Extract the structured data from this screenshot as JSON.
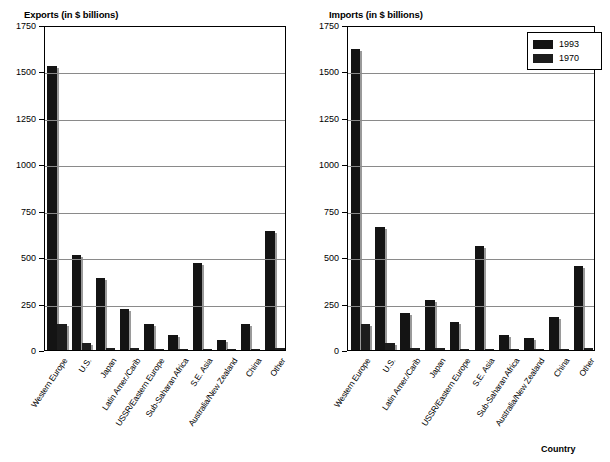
{
  "chart_data": [
    {
      "type": "bar",
      "title": "Exports (in $ billions)",
      "xlabel": "",
      "ylabel": "",
      "ylim": [
        0,
        1750
      ],
      "yticks": [
        0,
        250,
        500,
        750,
        1000,
        1250,
        1500,
        1750
      ],
      "grid": true,
      "legend_position": "none",
      "categories": [
        "Western Europe",
        "U.S.",
        "Japan",
        "Latin Amer./Carib",
        "USSR/Eastern Europe",
        "Sub-Saharan Africa",
        "S.E. Asia",
        "Australia/New Zealand",
        "China",
        "Other"
      ],
      "series": [
        {
          "name": "1993",
          "values": [
            1530,
            510,
            390,
            220,
            140,
            80,
            470,
            55,
            140,
            640
          ]
        },
        {
          "name": "1970",
          "values": [
            140,
            40,
            10,
            10,
            5,
            5,
            5,
            5,
            5,
            10
          ]
        }
      ]
    },
    {
      "type": "bar",
      "title": "Imports (in $ billions)",
      "xlabel": "Country",
      "ylabel": "",
      "ylim": [
        0,
        1750
      ],
      "yticks": [
        0,
        250,
        500,
        750,
        1000,
        1250,
        1500,
        1750
      ],
      "grid": true,
      "legend_position": "top-right",
      "categories": [
        "Western Europe",
        "U.S.",
        "Latin Amer./Carib",
        "Japan",
        "USSR/Eastern Europe",
        "S.E. Asia",
        "Sub-Saharan Africa",
        "Australia/New Zealand",
        "China",
        "Other"
      ],
      "series": [
        {
          "name": "1993",
          "values": [
            1620,
            660,
            200,
            270,
            150,
            560,
            80,
            65,
            180,
            450
          ]
        },
        {
          "name": "1970",
          "values": [
            140,
            40,
            10,
            10,
            5,
            5,
            5,
            5,
            5,
            10
          ]
        }
      ]
    }
  ],
  "legend": {
    "entries": [
      {
        "label": "1993",
        "color": "#141414"
      },
      {
        "label": "1970",
        "color": "#1d1d1d"
      }
    ]
  },
  "axis": {
    "country_label": "Country"
  },
  "colors": {
    "bar_1993": "#141414",
    "bar_1970": "#1d1d1d",
    "gridline": "#8a8a8a",
    "axis": "#000000",
    "background": "#ffffff"
  }
}
